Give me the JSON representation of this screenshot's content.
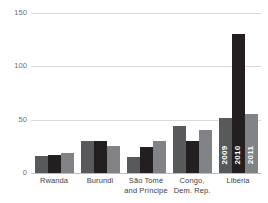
{
  "chart_data": {
    "type": "bar",
    "title": "",
    "subtitle": "",
    "xlabel": "",
    "ylabel": "",
    "ylim": [
      0,
      150
    ],
    "yticks": [
      0,
      50,
      100,
      150
    ],
    "ytick_labels": [
      "0",
      "50",
      "100",
      "150"
    ],
    "grid": true,
    "legend_position": "in-bars-last-group",
    "categories": [
      "Rwanda",
      "Burundi",
      "São Tomé and Príncipe",
      "Congo, Dem. Rep.",
      "Liberia"
    ],
    "category_lines": [
      [
        "Rwanda",
        ""
      ],
      [
        "Burundi",
        ""
      ],
      [
        "São Tomé",
        "and Príncipe"
      ],
      [
        "Congo,",
        "Dem. Rep."
      ],
      [
        "Liberia",
        ""
      ]
    ],
    "series": [
      {
        "name": "2009",
        "color": "#58595b",
        "values": [
          16,
          30,
          15,
          44,
          52
        ]
      },
      {
        "name": "2010",
        "color": "#231f20",
        "values": [
          17,
          30,
          24,
          30,
          130
        ]
      },
      {
        "name": "2011",
        "color": "#808285",
        "values": [
          19,
          25,
          30,
          40,
          55
        ]
      }
    ],
    "legend": [
      "2009",
      "2010",
      "2011"
    ],
    "colors": {
      "series_2009": "#58595b",
      "series_2010": "#231f20",
      "series_2011": "#808285",
      "gridline": "#d9d9d9",
      "baseline": "#bcbcbc",
      "tick_text": "#6d6e71",
      "axis_text": "#414042",
      "background": "#ffffff"
    }
  }
}
